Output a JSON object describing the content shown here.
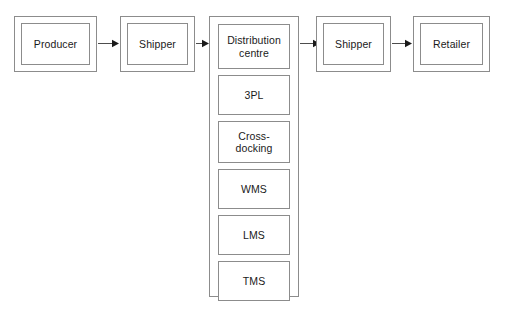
{
  "diagram": {
    "background_color": "#ffffff",
    "line_color": "#8c8c8c",
    "text_color": "#1a1a1a",
    "stages": [
      {
        "id": "producer",
        "label": "Producer",
        "style": "double-box"
      },
      {
        "id": "shipper-upstream",
        "label": "Shipper",
        "style": "double-box"
      },
      {
        "id": "distribution-centre",
        "label": "Distribution\ncentre",
        "style": "column-head"
      },
      {
        "id": "shipper-downstream",
        "label": "Shipper",
        "style": "double-box"
      },
      {
        "id": "retailer",
        "label": "Retailer",
        "style": "double-box"
      }
    ],
    "column_items": [
      {
        "id": "distribution-centre",
        "label": "Distribution\ncentre"
      },
      {
        "id": "3pl",
        "label": "3PL"
      },
      {
        "id": "cross-docking",
        "label": "Cross-\ndocking"
      },
      {
        "id": "wms",
        "label": "WMS"
      },
      {
        "id": "lms",
        "label": "LMS"
      },
      {
        "id": "tms",
        "label": "TMS"
      }
    ],
    "connectors": [
      {
        "id": "producer-to-shipper-upstream",
        "direction": "right"
      },
      {
        "id": "shipper-upstream-to-distribution-centre",
        "direction": "right"
      },
      {
        "id": "distribution-centre-to-shipper-downstream",
        "direction": "right"
      },
      {
        "id": "shipper-downstream-to-retailer",
        "direction": "right"
      }
    ]
  }
}
